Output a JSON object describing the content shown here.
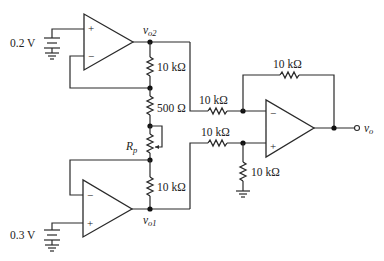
{
  "diagram": {
    "sources": {
      "top": {
        "label": "0.2 V"
      },
      "bottom": {
        "label": "0.3 V"
      }
    },
    "nodes": {
      "vo2": {
        "main": "v",
        "sub": "o2"
      },
      "vo1": {
        "main": "v",
        "sub": "o1"
      },
      "vo": {
        "main": "v",
        "sub": "o"
      }
    },
    "resistors": {
      "r_top_chain": "10 kΩ",
      "r_500": "500 Ω",
      "r_pot": {
        "main": "R",
        "sub": "p"
      },
      "r_bottom_chain": "10 kΩ",
      "r_in_minus": "10 kΩ",
      "r_in_plus": "10 kΩ",
      "r_feedback": "10 kΩ",
      "r_ground": "10 kΩ"
    },
    "opamps": {
      "top": {
        "plus": "+",
        "minus": "−"
      },
      "bottom": {
        "plus": "+",
        "minus": "−"
      },
      "output": {
        "plus": "+",
        "minus": "−"
      }
    }
  }
}
